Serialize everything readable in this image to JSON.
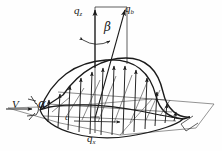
{
  "figure": {
    "kind": "engineering-line-diagram",
    "background_color": "#fefefe",
    "ink_color": "#1a1a1a"
  },
  "labels": {
    "q_z": {
      "base": "q",
      "sub": "z"
    },
    "q_b": {
      "base": "q",
      "sub": "b"
    },
    "q_x": {
      "base": "q",
      "sub": "x"
    },
    "beta": "β",
    "alpha": "α",
    "velocity": "V",
    "chord": "c"
  },
  "vectors": [
    {
      "name": "q_z",
      "note": "vertical resultant arrow, upward"
    },
    {
      "name": "q_b",
      "note": "inclined resultant arrow, upward-right"
    },
    {
      "name": "q_x",
      "note": "downward reference line below planform"
    },
    {
      "name": "V",
      "note": "freestream velocity arrow pointing right"
    }
  ],
  "angles": [
    {
      "name": "beta",
      "between": [
        "q_z",
        "q_b"
      ],
      "note": "angle at apex between vertical and inclined vectors"
    },
    {
      "name": "alpha",
      "between": [
        "V",
        "chord-line"
      ],
      "note": "angle of attack at left leading edge"
    }
  ]
}
